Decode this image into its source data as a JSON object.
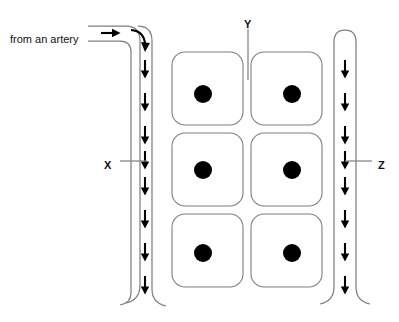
{
  "diagram": {
    "canvas": {
      "width": 399,
      "height": 322,
      "background": "#ffffff"
    },
    "colors": {
      "vessel_stroke": "#7f7f7f",
      "cell_stroke": "#7f7f7f",
      "nucleus_fill": "#000000",
      "arrow_fill": "#000000",
      "leader_stroke": "#7f7f7f",
      "text_fill": "#111111",
      "background": "#ffffff"
    },
    "labels": {
      "inlet_caption": "from an artery",
      "vessel_left": "X",
      "interstitium_middle": "Y",
      "vessel_right": "Z"
    },
    "structures": {
      "left_vessel": {
        "name": "arteriole-capillary",
        "label": "X",
        "flow_direction": "down",
        "arrow_count": 8,
        "inlet": "horizontal-from-left-bends-down",
        "outlet": "curves-outward-at-bottom"
      },
      "right_vessel": {
        "name": "venule-capillary",
        "label": "Z",
        "flow_direction": "down",
        "arrow_count": 8,
        "inlet": "closed-rounded-top",
        "outlet": "curves-outward-at-bottom"
      },
      "middle_space": {
        "name": "interstitial-space",
        "label": "Y",
        "pointer": "vertical-line-down-into-gap"
      },
      "cells": {
        "name": "tissue-cells",
        "rows": 3,
        "columns": 2,
        "count": 6,
        "shape": "rounded-square",
        "nucleus": "filled-black-circle"
      }
    },
    "cell_grid": [
      {
        "id": "cell-r1c1",
        "row": 1,
        "col": 1,
        "x": 172,
        "y": 52,
        "w": 71,
        "h": 73
      },
      {
        "id": "cell-r1c2",
        "row": 1,
        "col": 2,
        "x": 251,
        "y": 52,
        "w": 71,
        "h": 73
      },
      {
        "id": "cell-r2c1",
        "row": 2,
        "col": 1,
        "x": 172,
        "y": 133,
        "w": 71,
        "h": 73
      },
      {
        "id": "cell-r2c2",
        "row": 2,
        "col": 2,
        "x": 251,
        "y": 133,
        "w": 71,
        "h": 73
      },
      {
        "id": "cell-r3c1",
        "row": 3,
        "col": 1,
        "x": 172,
        "y": 214,
        "w": 71,
        "h": 73
      },
      {
        "id": "cell-r3c2",
        "row": 3,
        "col": 2,
        "x": 251,
        "y": 214,
        "w": 71,
        "h": 73
      }
    ],
    "left_arrow_positions_y": [
      66,
      99,
      132,
      157,
      183,
      216,
      249,
      282
    ],
    "right_arrow_positions_y": [
      66,
      99,
      132,
      157,
      183,
      216,
      249,
      282
    ],
    "label_positions": {
      "inlet_caption": {
        "x": 10,
        "y": 38
      },
      "X": {
        "x": 108,
        "y": 164
      },
      "Y": {
        "x": 245,
        "y": 24
      },
      "Z": {
        "x": 379,
        "y": 164
      }
    }
  }
}
